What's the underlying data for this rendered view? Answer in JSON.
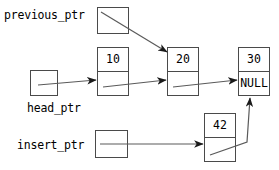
{
  "diagram": {
    "type": "linked-list",
    "stroke_color": "#4a4a4a",
    "text_color": "#000000",
    "background_color": "#ffffff",
    "labels": {
      "previous_ptr": "previous_ptr",
      "head_ptr": "head_ptr",
      "insert_ptr": "insert_ptr"
    },
    "nodes": [
      {
        "id": "node10",
        "data": "10",
        "next": ""
      },
      {
        "id": "node20",
        "data": "20",
        "next": ""
      },
      {
        "id": "node30",
        "data": "30",
        "next": "NULL"
      },
      {
        "id": "node42",
        "data": "42",
        "next": ""
      }
    ],
    "pointers": [
      {
        "name": "previous_ptr",
        "target": "node20"
      },
      {
        "name": "head_ptr",
        "target": "node10"
      },
      {
        "name": "insert_ptr",
        "target": "node42"
      }
    ],
    "links": [
      {
        "from": "node10",
        "to": "node20"
      },
      {
        "from": "node20",
        "to": "node30"
      },
      {
        "from": "node42",
        "to": "node30"
      }
    ]
  }
}
